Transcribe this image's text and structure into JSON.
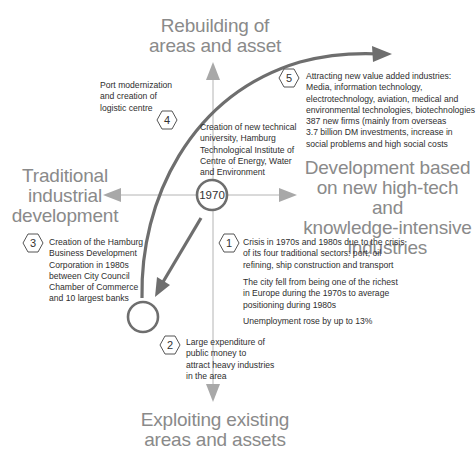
{
  "axes": {
    "top_label": "Rebuilding of\nareas and asset",
    "left_label": "Traditional\nindustrial\ndevelopment",
    "right_label": "Development based\non new high-tech and\nknowledge-intensive\nindustries",
    "bottom_label": "Exploiting existing\nareas and assets",
    "origin_label": "1970"
  },
  "steps": [
    {
      "number": "1",
      "text": "Crisis in 1970s and 1980s due to the crisis\nof its four traditional sectors: port, oil\nrefining, ship construction and transport",
      "extra": [
        "The city fell from being one of the richest\nin Europe during the 1970s to average\npositioning during 1980s",
        "Unemployment rose by up to 13%"
      ]
    },
    {
      "number": "2",
      "text": "Large expenditure of\npublic money to\nattract heavy industries\nin the area"
    },
    {
      "number": "3",
      "text": "Creation of the Hamburg\nBusiness Development\nCorporation in 1980s\nbetween City Council\nChamber of Commerce\nand 10 largest banks"
    },
    {
      "number": "4",
      "text": "Creation of new technical\nuniversity, Hamburg\nTechnological Institute of\nCentre of Energy, Water\nand Environment",
      "side_note": "Port modernization\nand creation of\nlogistic centre"
    },
    {
      "number": "5",
      "text": "Attracting new value added industries:\nMedia, information technology,\nelectrotechnology, aviation, medical and\nenvironmental technologies, biotechnologies\n387 new firms (mainly from overseas\n3.7 billion DM investments, increase in\nsocial problems and high social costs"
    }
  ],
  "colors": {
    "axis": "#a8a8a8",
    "path": "#6e6e6e",
    "label": "#8a8a8a",
    "text": "#2e2e2e"
  }
}
